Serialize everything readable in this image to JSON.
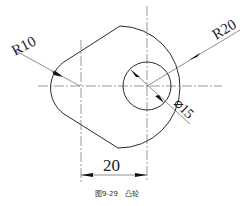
{
  "drawing": {
    "labels": {
      "r_small": "R10",
      "r_large": "R20",
      "hole_diameter": "⌀15",
      "center_distance": "20"
    },
    "caption": "图9-29　凸轮"
  },
  "colors": {
    "line": "#2a2a2a",
    "centerline": "#555555",
    "background": "#ffffff"
  }
}
